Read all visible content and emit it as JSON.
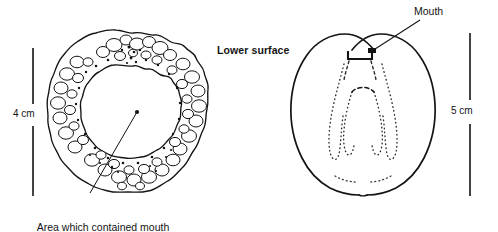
{
  "figure": {
    "kind": "scientific-line-drawing",
    "background_color": "#ffffff",
    "ink_color": "#141414"
  },
  "left_panel": {
    "subject": "ring-shaped specimen with nodular surface",
    "center_marker": "dot",
    "caption": {
      "line1": "Area which contained mouth",
      "line2": "and jaws"
    },
    "scale_bar": {
      "label": "4 cm"
    }
  },
  "right_panel": {
    "subject": "heart-shaped specimen outline with dotted internal structures",
    "title": "Lower surface",
    "mouth_label": "Mouth",
    "scale_bar": {
      "label": "5 cm"
    }
  }
}
